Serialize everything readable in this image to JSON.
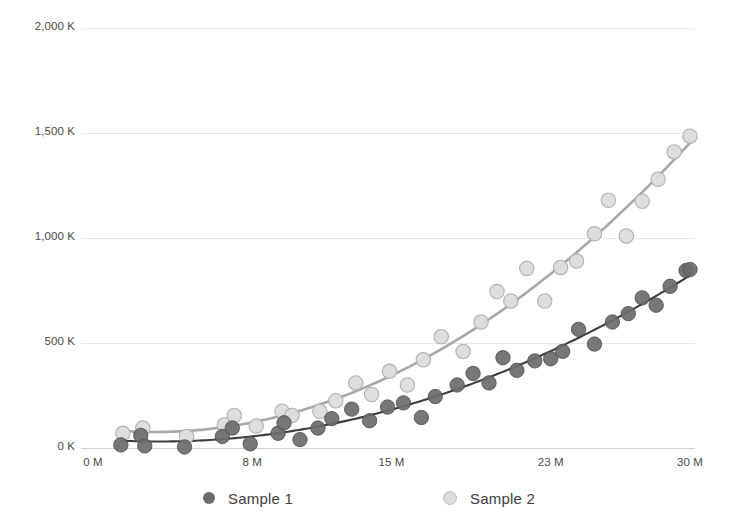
{
  "chart_data": {
    "type": "scatter",
    "title": "",
    "subtitle": "",
    "xlabel": "",
    "ylabel": "",
    "xlim": [
      0,
      30
    ],
    "ylim": [
      0,
      2000
    ],
    "grid": true,
    "grid_axis": "y",
    "legend_position": "bottom",
    "x_unit_suffix": "M",
    "y_unit_suffix": "K",
    "xticks": [
      0,
      8,
      15,
      23,
      30
    ],
    "xtick_labels": [
      "0 M",
      "8 M",
      "15 M",
      "23 M",
      "30 M"
    ],
    "yticks": [
      0,
      500,
      1000,
      1500,
      2000
    ],
    "ytick_labels": [
      "0 K",
      "500 K",
      "1,000 K",
      "1,500 K",
      "2,000 K"
    ],
    "series": [
      {
        "name": "Sample 1",
        "color": "#595959",
        "marker_fill": "#6b6b6b",
        "marker_edge": "#4a4a4a",
        "trendline_color": "#3d3d3d",
        "trendline_type": "quadratic",
        "points": [
          [
            1.4,
            15
          ],
          [
            2.4,
            60
          ],
          [
            2.6,
            10
          ],
          [
            4.6,
            5
          ],
          [
            6.5,
            55
          ],
          [
            7.0,
            95
          ],
          [
            7.9,
            20
          ],
          [
            9.3,
            70
          ],
          [
            9.6,
            120
          ],
          [
            10.4,
            40
          ],
          [
            11.3,
            95
          ],
          [
            12.0,
            140
          ],
          [
            13.0,
            185
          ],
          [
            13.9,
            130
          ],
          [
            14.8,
            195
          ],
          [
            15.6,
            215
          ],
          [
            16.5,
            145
          ],
          [
            17.2,
            245
          ],
          [
            18.3,
            300
          ],
          [
            19.1,
            355
          ],
          [
            19.9,
            310
          ],
          [
            20.6,
            430
          ],
          [
            21.3,
            370
          ],
          [
            22.2,
            415
          ],
          [
            23.0,
            425
          ],
          [
            23.6,
            460
          ],
          [
            24.4,
            565
          ],
          [
            25.2,
            495
          ],
          [
            26.1,
            600
          ],
          [
            26.9,
            640
          ],
          [
            27.6,
            715
          ],
          [
            28.3,
            680
          ],
          [
            29.0,
            770
          ],
          [
            29.8,
            845
          ],
          [
            30.0,
            850
          ]
        ]
      },
      {
        "name": "Sample 2",
        "color": "#d6d6d6",
        "marker_fill": "#dcdcdc",
        "marker_edge": "#b0b0b0",
        "trendline_color": "#a8a8a8",
        "trendline_type": "quadratic",
        "points": [
          [
            1.5,
            70
          ],
          [
            2.5,
            95
          ],
          [
            4.7,
            55
          ],
          [
            6.6,
            110
          ],
          [
            7.1,
            155
          ],
          [
            8.2,
            105
          ],
          [
            9.5,
            175
          ],
          [
            10.0,
            155
          ],
          [
            11.4,
            175
          ],
          [
            12.2,
            225
          ],
          [
            13.2,
            310
          ],
          [
            14.0,
            255
          ],
          [
            14.9,
            365
          ],
          [
            15.8,
            300
          ],
          [
            16.6,
            420
          ],
          [
            17.5,
            530
          ],
          [
            18.6,
            460
          ],
          [
            19.5,
            600
          ],
          [
            20.3,
            745
          ],
          [
            21.0,
            700
          ],
          [
            21.8,
            855
          ],
          [
            22.7,
            700
          ],
          [
            23.5,
            860
          ],
          [
            24.3,
            890
          ],
          [
            25.2,
            1020
          ],
          [
            25.9,
            1180
          ],
          [
            26.8,
            1010
          ],
          [
            27.6,
            1175
          ],
          [
            28.4,
            1280
          ],
          [
            29.2,
            1410
          ],
          [
            30.0,
            1485
          ]
        ]
      }
    ]
  },
  "legend": {
    "items": [
      {
        "label": "Sample 1",
        "color": "#6b6b6b"
      },
      {
        "label": "Sample 2",
        "color": "#dcdcdc"
      }
    ]
  },
  "axes": {
    "y_labels": [
      "2,000 K",
      "1,500 K",
      "1,000 K",
      "500 K",
      "0 K"
    ],
    "x_labels": [
      "0 M",
      "8 M",
      "15 M",
      "23 M",
      "30 M"
    ]
  },
  "colors": {
    "background": "#ffffff",
    "gridline": "#e8e8e8",
    "axisline": "#cfcfcf",
    "text": "#4a4a4a",
    "series1": "#6b6b6b",
    "series2": "#dcdcdc"
  }
}
